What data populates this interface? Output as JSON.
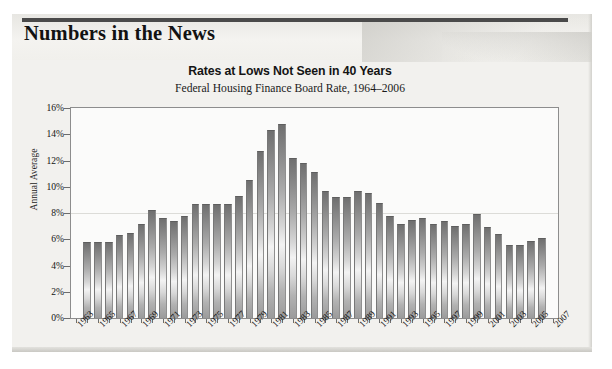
{
  "masthead": {
    "title": "Numbers in the News",
    "rule_color": "#4a4a4a"
  },
  "card": {
    "background_color": "#f2f1ee"
  },
  "chart_data": {
    "type": "bar",
    "title": "Rates at Lows Not Seen in 40 Years",
    "subtitle": "Federal Housing Finance Board Rate, 1964–2006",
    "xlabel": "",
    "ylabel": "Annual Average",
    "ylim": [
      0,
      16
    ],
    "ytick_values": [
      0,
      2,
      4,
      6,
      8,
      10,
      12,
      14,
      16
    ],
    "ytick_labels": [
      "0%",
      "2%",
      "4%",
      "6%",
      "8%",
      "10%",
      "12%",
      "14%",
      "16%"
    ],
    "gridlines": [
      8
    ],
    "grid": "horizontal-single",
    "legend": "none",
    "bar_color_top": "#6f6f6f",
    "bar_color_mid": "#f3f3f3",
    "bar_color_bottom": "#9b9b9b",
    "x_axis_range": [
      "1963",
      "2007"
    ],
    "xtick_labels": [
      "1963",
      "1965",
      "1967",
      "1969",
      "1971",
      "1973",
      "1975",
      "1977",
      "1979",
      "1981",
      "1983",
      "1985",
      "1987",
      "1989",
      "1991",
      "1993",
      "1995",
      "1997",
      "1999",
      "2001",
      "2003",
      "2005",
      "2007"
    ],
    "categories": [
      "1964",
      "1965",
      "1966",
      "1967",
      "1968",
      "1969",
      "1970",
      "1971",
      "1972",
      "1973",
      "1974",
      "1975",
      "1976",
      "1977",
      "1978",
      "1979",
      "1980",
      "1981",
      "1982",
      "1983",
      "1984",
      "1985",
      "1986",
      "1987",
      "1988",
      "1989",
      "1990",
      "1991",
      "1992",
      "1993",
      "1994",
      "1995",
      "1996",
      "1997",
      "1998",
      "1999",
      "2000",
      "2001",
      "2002",
      "2003",
      "2004",
      "2005",
      "2006"
    ],
    "values": [
      5.8,
      5.8,
      5.8,
      6.3,
      6.5,
      7.2,
      8.2,
      7.6,
      7.4,
      7.8,
      8.7,
      8.7,
      8.7,
      8.7,
      9.3,
      10.5,
      12.7,
      14.3,
      14.8,
      12.2,
      11.8,
      11.1,
      9.7,
      9.2,
      9.2,
      9.7,
      9.5,
      8.8,
      7.8,
      7.2,
      7.5,
      7.6,
      7.2,
      7.4,
      7.0,
      7.2,
      7.9,
      6.9,
      6.4,
      5.6,
      5.6,
      5.9,
      6.1
    ]
  }
}
